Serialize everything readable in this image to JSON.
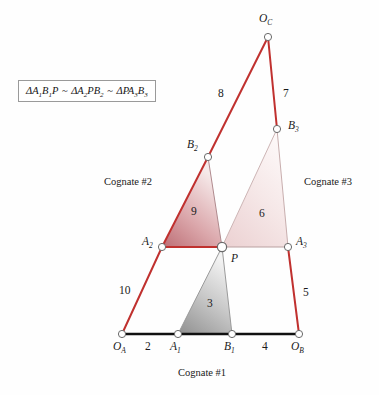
{
  "figure": {
    "width": 379,
    "height": 395,
    "background": "#fefefe"
  },
  "formula": {
    "full_text": "ΔA1B1P ~ ΔA2PB2 ~ ΔPA3B3",
    "delta": "Δ",
    "tilde": "~",
    "term1_main": "A",
    "term1_sub1": "1",
    "term1_mid": "B",
    "term1_sub2": "1",
    "term1_end": "P",
    "term2_main": "A",
    "term2_sub1": "2",
    "term2_mid": "PB",
    "term2_sub2": "2",
    "term3_main": "PA",
    "term3_sub1": "3",
    "term3_mid": "B",
    "term3_sub2": "3"
  },
  "colors": {
    "red_link": "#c0312f",
    "black_link": "#101010",
    "node_stroke": "#6a6a6a",
    "node_fill": "#ffffff",
    "tri2_dark": "#c4787e",
    "tri2_light": "#f0dede",
    "tri3_dark": "#edd5d6",
    "tri3_light": "#fbf3f3",
    "tri1_dark": "#8f8f8f",
    "tri1_light": "#e8e8e8",
    "thin_edge": "#b9a0a0"
  },
  "points": [
    {
      "id": "OA",
      "label_main": "O",
      "label_sub": "A",
      "x": 122,
      "y": 334,
      "lx": 113,
      "ly": 341
    },
    {
      "id": "A1",
      "label_main": "A",
      "label_sub": "1",
      "x": 178,
      "y": 334,
      "lx": 170,
      "ly": 341
    },
    {
      "id": "B1",
      "label_main": "B",
      "label_sub": "1",
      "x": 232,
      "y": 334,
      "lx": 224,
      "ly": 341
    },
    {
      "id": "OB",
      "label_main": "O",
      "label_sub": "B",
      "x": 299,
      "y": 334,
      "lx": 291,
      "ly": 341
    },
    {
      "id": "A2",
      "label_main": "A",
      "label_sub": "2",
      "x": 162,
      "y": 247,
      "lx": 142,
      "ly": 236
    },
    {
      "id": "P",
      "label_main": "P",
      "label_sub": "",
      "x": 222,
      "y": 247,
      "lx": 231,
      "ly": 254
    },
    {
      "id": "A3",
      "label_main": "A",
      "label_sub": "3",
      "x": 288,
      "y": 247,
      "lx": 296,
      "ly": 236
    },
    {
      "id": "B2",
      "label_main": "B",
      "label_sub": "2",
      "x": 208,
      "y": 157,
      "lx": 187,
      "ly": 141
    },
    {
      "id": "B3",
      "label_main": "B",
      "label_sub": "3",
      "x": 277,
      "y": 129,
      "lx": 288,
      "ly": 122
    },
    {
      "id": "OC",
      "label_main": "O",
      "label_sub": "C",
      "x": 268,
      "y": 37,
      "lx": 259,
      "ly": 14
    }
  ],
  "links": [
    {
      "from": "OA",
      "to": "A1",
      "color": "black_link",
      "width": 2.6
    },
    {
      "from": "B1",
      "to": "OB",
      "color": "black_link",
      "width": 2.6
    },
    {
      "from": "OA",
      "to": "A2",
      "color": "red_link",
      "width": 2.0
    },
    {
      "from": "A2",
      "to": "B2",
      "color": "red_link",
      "width": 2.0
    },
    {
      "from": "B2",
      "to": "OC",
      "color": "red_link",
      "width": 2.0
    },
    {
      "from": "OC",
      "to": "B3",
      "color": "red_link",
      "width": 2.0
    },
    {
      "from": "B3",
      "to": "A3",
      "color": "thin_edge",
      "width": 1.0
    },
    {
      "from": "A3",
      "to": "OB",
      "color": "red_link",
      "width": 2.0
    },
    {
      "from": "A2",
      "to": "P",
      "color": "red_link",
      "width": 2.0
    },
    {
      "from": "P",
      "to": "A3",
      "color": "thin_edge",
      "width": 1.0
    },
    {
      "from": "P",
      "to": "B2",
      "color": "thin_edge",
      "width": 1.0
    },
    {
      "from": "P",
      "to": "B3",
      "color": "thin_edge",
      "width": 1.0
    },
    {
      "from": "A1",
      "to": "P",
      "color": "thin_edge",
      "width": 1.0
    },
    {
      "from": "B1",
      "to": "P",
      "color": "thin_edge",
      "width": 1.0
    },
    {
      "from": "A1",
      "to": "B1",
      "color": "black_link",
      "width": 2.6
    }
  ],
  "triangles": [
    {
      "id": "tri1",
      "number": "3",
      "vertices": [
        "A1",
        "B1",
        "P"
      ],
      "fill_dark": "#8f8f8f",
      "fill_light": "#eeeeee",
      "nx": 210,
      "ny": 303
    },
    {
      "id": "tri2",
      "number": "9",
      "vertices": [
        "A2",
        "P",
        "B2"
      ],
      "fill_dark": "#c4787e",
      "fill_light": "#f3e4e4",
      "nx": 194,
      "ny": 211
    },
    {
      "id": "tri3",
      "number": "6",
      "vertices": [
        "P",
        "A3",
        "B3"
      ],
      "fill_dark": "#eed7d8",
      "fill_light": "#fdf7f7",
      "nx": 262,
      "ny": 213
    }
  ],
  "edge_labels": [
    {
      "id": "len-oa-a1",
      "text": "2",
      "x": 145,
      "y": 341
    },
    {
      "id": "len-b1-ob",
      "text": "4",
      "x": 262,
      "y": 341
    },
    {
      "id": "len-oa-a2",
      "text": "10",
      "x": 124,
      "y": 285
    },
    {
      "id": "len-b2-oc",
      "text": "8",
      "x": 221,
      "y": 88
    },
    {
      "id": "len-oc-b3",
      "text": "7",
      "x": 283,
      "y": 88
    },
    {
      "id": "len-a3-ob",
      "text": "5",
      "x": 303,
      "y": 287
    }
  ],
  "annotations": [
    {
      "id": "cognate-2",
      "text": "Cognate #2",
      "x": 104,
      "y": 177
    },
    {
      "id": "cognate-3",
      "text": "Cognate #3",
      "x": 304,
      "y": 177
    },
    {
      "id": "cognate-1",
      "text": "Cognate #1",
      "x": 178,
      "y": 371
    }
  ]
}
